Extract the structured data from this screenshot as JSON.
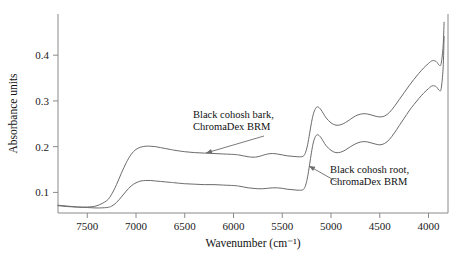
{
  "chart_data": {
    "type": "line",
    "title": "",
    "xlabel": "Wavenumber (cm⁻¹)",
    "ylabel": "Absorbance units",
    "xlim": [
      7800,
      3800
    ],
    "ylim": [
      0.055,
      0.49
    ],
    "x_inverted": true,
    "grid": false,
    "legend_position": "inline-annotations",
    "xticks": [
      7500,
      7000,
      6500,
      6000,
      5500,
      5000,
      4500,
      4000
    ],
    "xticklabels": [
      "7500",
      "7000",
      "6500",
      "6000",
      "5500",
      "5000",
      "4500",
      "4000"
    ],
    "yticks": [
      0.1,
      0.2,
      0.3,
      0.4
    ],
    "yticklabels": [
      "0.1",
      "0.2",
      "0.3",
      "0.4"
    ],
    "series": [
      {
        "name": "Black cohosh bark, ChromaDex BRM",
        "color": "#6b6b6b",
        "x": [
          7800,
          7700,
          7600,
          7500,
          7400,
          7300,
          7250,
          7200,
          7150,
          7100,
          7050,
          7000,
          6950,
          6900,
          6850,
          6800,
          6750,
          6700,
          6650,
          6600,
          6500,
          6400,
          6300,
          6200,
          6100,
          6000,
          5950,
          5900,
          5850,
          5800,
          5750,
          5700,
          5650,
          5600,
          5550,
          5500,
          5450,
          5400,
          5350,
          5300,
          5280,
          5260,
          5240,
          5220,
          5200,
          5180,
          5160,
          5140,
          5120,
          5100,
          5080,
          5050,
          5000,
          4950,
          4900,
          4850,
          4800,
          4750,
          4700,
          4650,
          4600,
          4550,
          4500,
          4450,
          4400,
          4350,
          4300,
          4250,
          4200,
          4150,
          4100,
          4050,
          4000,
          3960,
          3920,
          3890,
          3870,
          3850,
          3840
        ],
        "y": [
          0.071,
          0.069,
          0.068,
          0.068,
          0.071,
          0.082,
          0.096,
          0.117,
          0.142,
          0.165,
          0.183,
          0.194,
          0.199,
          0.201,
          0.201,
          0.2,
          0.198,
          0.196,
          0.194,
          0.192,
          0.189,
          0.187,
          0.186,
          0.185,
          0.184,
          0.183,
          0.182,
          0.18,
          0.178,
          0.177,
          0.178,
          0.181,
          0.184,
          0.185,
          0.184,
          0.182,
          0.18,
          0.179,
          0.178,
          0.178,
          0.18,
          0.188,
          0.204,
          0.228,
          0.253,
          0.272,
          0.283,
          0.287,
          0.285,
          0.28,
          0.273,
          0.263,
          0.252,
          0.247,
          0.248,
          0.253,
          0.26,
          0.267,
          0.271,
          0.272,
          0.27,
          0.267,
          0.265,
          0.267,
          0.275,
          0.288,
          0.303,
          0.318,
          0.333,
          0.347,
          0.36,
          0.372,
          0.382,
          0.388,
          0.386,
          0.378,
          0.382,
          0.42,
          0.472
        ]
      },
      {
        "name": "Black cohosh root, ChromaDex BRM",
        "color": "#6b6b6b",
        "x": [
          7800,
          7700,
          7600,
          7500,
          7400,
          7300,
          7250,
          7200,
          7150,
          7100,
          7050,
          7000,
          6950,
          6900,
          6850,
          6800,
          6750,
          6700,
          6650,
          6600,
          6500,
          6400,
          6300,
          6200,
          6100,
          6000,
          5950,
          5900,
          5850,
          5800,
          5750,
          5700,
          5650,
          5600,
          5550,
          5500,
          5450,
          5400,
          5350,
          5300,
          5280,
          5260,
          5240,
          5220,
          5200,
          5180,
          5160,
          5140,
          5120,
          5100,
          5080,
          5050,
          5000,
          4950,
          4900,
          4850,
          4800,
          4750,
          4700,
          4650,
          4600,
          4550,
          4500,
          4450,
          4400,
          4350,
          4300,
          4250,
          4200,
          4150,
          4100,
          4050,
          4000,
          3960,
          3920,
          3890,
          3870,
          3850,
          3840
        ],
        "y": [
          0.072,
          0.07,
          0.068,
          0.067,
          0.066,
          0.067,
          0.07,
          0.078,
          0.09,
          0.103,
          0.114,
          0.121,
          0.125,
          0.126,
          0.126,
          0.125,
          0.124,
          0.123,
          0.122,
          0.121,
          0.119,
          0.118,
          0.117,
          0.117,
          0.116,
          0.115,
          0.114,
          0.112,
          0.11,
          0.109,
          0.108,
          0.108,
          0.109,
          0.11,
          0.11,
          0.109,
          0.107,
          0.106,
          0.105,
          0.105,
          0.107,
          0.116,
          0.134,
          0.16,
          0.188,
          0.21,
          0.222,
          0.226,
          0.224,
          0.219,
          0.212,
          0.202,
          0.192,
          0.187,
          0.188,
          0.193,
          0.2,
          0.206,
          0.21,
          0.211,
          0.209,
          0.206,
          0.204,
          0.207,
          0.216,
          0.23,
          0.246,
          0.262,
          0.278,
          0.292,
          0.305,
          0.317,
          0.327,
          0.333,
          0.331,
          0.323,
          0.327,
          0.372,
          0.441
        ]
      }
    ],
    "annotations": [
      {
        "id": "bark-label",
        "lines": [
          "Black cohosh bark,",
          "ChromaDex BRM"
        ],
        "text_x": 193,
        "text_y": 118,
        "arrow_from_x": 264,
        "arrow_from_y": 136,
        "arrow_to_x": 206,
        "arrow_to_y": 153
      },
      {
        "id": "root-label",
        "lines": [
          "Black cohosh root,",
          "ChromaDex BRM"
        ],
        "text_x": 330,
        "text_y": 173,
        "arrow_from_x": 339,
        "arrow_from_y": 183,
        "arrow_to_x": 309,
        "arrow_to_y": 166
      }
    ]
  },
  "axes": {
    "x_title": "Wavenumber (cm⁻¹)",
    "y_title": "Absorbance units"
  }
}
